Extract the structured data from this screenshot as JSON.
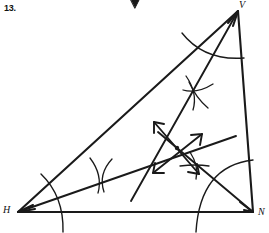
{
  "page": {
    "problem_number": "13.",
    "background": "#ffffff",
    "ink_color": "#1a1a1a"
  },
  "figure": {
    "name": "triangle-angle-bisector-construction",
    "width": 269,
    "height": 233,
    "vertices": [
      {
        "label": "V",
        "x": 238,
        "y": 11,
        "label_x": 239,
        "label_y": -1
      },
      {
        "label": "H",
        "x": 18,
        "y": 212,
        "label_x": 3,
        "label_y": 204
      },
      {
        "label": "N",
        "x": 253,
        "y": 212,
        "label_x": 258,
        "label_y": 206
      }
    ],
    "sides": [
      {
        "name": "side-HV",
        "from": "H",
        "to": "V"
      },
      {
        "name": "side-VN",
        "from": "V",
        "to": "N"
      },
      {
        "name": "side-HN",
        "from": "H",
        "to": "N"
      }
    ],
    "bisectors": [
      {
        "name": "bisector-from-H",
        "from_x": 18,
        "from_y": 212,
        "to_x": 234,
        "to_y": 136
      },
      {
        "name": "bisector-from-V",
        "from_x": 238,
        "from_y": 11,
        "to_x": 132,
        "to_y": 200
      },
      {
        "name": "bisector-from-N",
        "from_x": 253,
        "from_y": 212,
        "to_x": 160,
        "to_y": 134
      }
    ],
    "incenter": {
      "name": "incenter-point",
      "x": 177,
      "y": 148
    },
    "arrows": [
      {
        "name": "double-arrow-upleft-downright",
        "x1": 153,
        "y1": 122,
        "x2": 200,
        "y2": 175
      },
      {
        "name": "double-arrow-downleft-upright",
        "x1": 153,
        "y1": 173,
        "x2": 202,
        "y2": 135
      }
    ],
    "arc_marks": [
      {
        "name": "arc-at-H"
      },
      {
        "name": "arc-at-V"
      },
      {
        "name": "arc-at-N"
      },
      {
        "name": "arc-cross-left"
      },
      {
        "name": "arc-cross-upper"
      },
      {
        "name": "arc-cross-lower"
      }
    ],
    "top_marker": {
      "name": "page-top-arrow-marker",
      "x": 135,
      "y": 2
    }
  }
}
